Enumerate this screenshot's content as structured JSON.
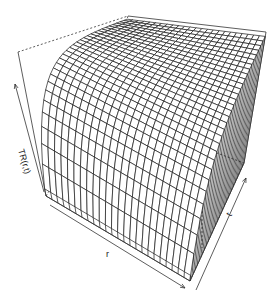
{
  "chart_data": {
    "type": "surface",
    "title": "",
    "xlabel": "r",
    "ylabel": "t",
    "zlabel": "TR(r,t)",
    "grid": true,
    "surface_description": "Wireframe perspective surface: TR rises steeply from a low value at one edge of t and saturates to a plateau across r",
    "grid_lines_r": 24,
    "grid_lines_t": 30,
    "ticks": "none (arrow axes only)"
  },
  "colors": {
    "background": "#ffffff",
    "wire": "#1a1a1a",
    "box": "#333333"
  },
  "axes": {
    "x_label": "r",
    "y_label": "t",
    "z_label": "TR(r,t)"
  }
}
